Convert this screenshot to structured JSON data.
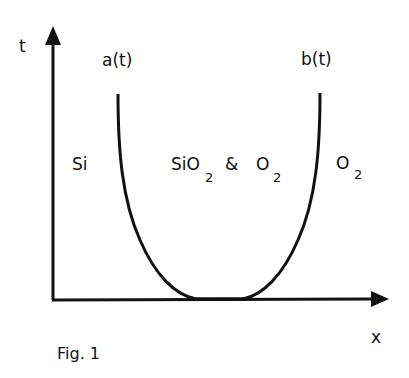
{
  "figure": {
    "caption": "Fig. 1",
    "axes": {
      "x_label": "x",
      "y_label": "t"
    },
    "curves": [
      {
        "name": "left-boundary",
        "label": "a(t)"
      },
      {
        "name": "right-boundary",
        "label": "b(t)"
      }
    ],
    "regions": {
      "left": {
        "text": "Si"
      },
      "middle": {
        "main1": "SiO",
        "sub1": "2",
        "amp": "&",
        "main2": "O",
        "sub2": "2"
      },
      "right": {
        "main": "O",
        "sub": "2"
      }
    },
    "colors": {
      "ink": "#111111",
      "background": "#ffffff"
    }
  }
}
